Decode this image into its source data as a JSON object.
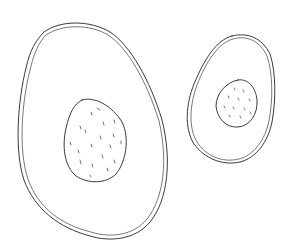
{
  "image": {
    "subject": "line drawing of two avocado halves",
    "background": "#ffffff",
    "stroke_color": "#3a3a3a"
  },
  "avocados": [
    {
      "name": "large-avocado-half",
      "has_pit": true
    },
    {
      "name": "small-avocado-half",
      "has_pit": true
    }
  ]
}
